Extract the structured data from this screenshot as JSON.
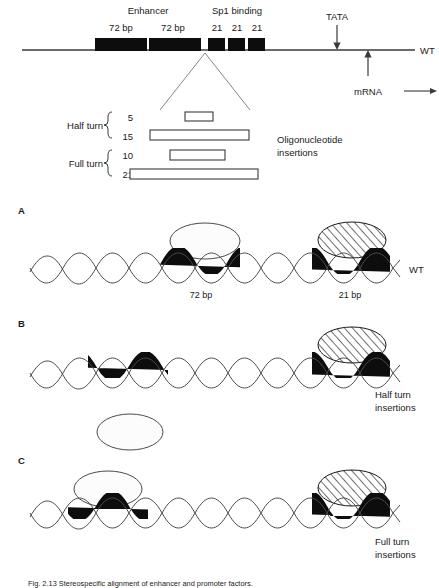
{
  "figure": {
    "top_map": {
      "enhancer_label": "Enhancer",
      "enhancer_boxes": [
        "72 bp",
        "72 bp"
      ],
      "sp1_label": "Sp1 binding",
      "sp1_boxes": [
        "21",
        "21",
        "21"
      ],
      "tata_label": "TATA",
      "mrna_label": "mRNA",
      "wt_label": "WT"
    },
    "insertions": {
      "title_line1": "Oligonucleotide",
      "title_line2": "insertions",
      "groups": [
        {
          "name": "Half turn",
          "values": [
            "5",
            "15"
          ]
        },
        {
          "name": "Full turn",
          "values": [
            "10",
            "21"
          ]
        }
      ]
    },
    "panels": [
      {
        "letter": "A",
        "right_label_line1": "WT",
        "right_label_line2": "",
        "dna_labels": [
          "72 bp",
          "21 bp"
        ],
        "proteins": [
          {
            "style": "blank",
            "position": "above-center"
          },
          {
            "style": "hatched",
            "position": "above-right"
          }
        ]
      },
      {
        "letter": "B",
        "right_label_line1": "Half turn",
        "right_label_line2": "insertions",
        "dna_labels": [],
        "proteins": [
          {
            "style": "hatched",
            "position": "above-right"
          },
          {
            "style": "blank",
            "position": "below-left"
          }
        ]
      },
      {
        "letter": "C",
        "right_label_line1": "Full turn",
        "right_label_line2": "insertions",
        "dna_labels": [],
        "proteins": [
          {
            "style": "blank",
            "position": "above-left"
          },
          {
            "style": "hatched",
            "position": "above-right"
          }
        ]
      }
    ],
    "caption": "Fig. 2.13   Stereospecific alignment of enhancer and promoter factors.",
    "colors": {
      "ink": "#1a1a1a",
      "line": "#3a3a3a",
      "box_fill": "#0d0d0d",
      "ellipse_stroke": "#4a4a4a",
      "background": "#ffffff"
    }
  }
}
